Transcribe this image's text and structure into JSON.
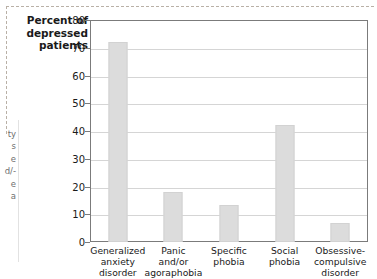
{
  "chart_data": {
    "type": "bar",
    "title": "",
    "ylabel": "Percent of depressed patients",
    "xlabel": "",
    "ylim": [
      0,
      80
    ],
    "yticks": [
      0,
      10,
      20,
      30,
      40,
      50,
      60,
      70,
      80
    ],
    "grid": true,
    "legend": false,
    "categories": [
      "Generalized anxiety disorder",
      "Panic and/or agoraphobia",
      "Specific phobia",
      "Social phobia",
      "Obsessive-compulsive disorder"
    ],
    "category_lines": [
      [
        "Generalized",
        "anxiety",
        "disorder"
      ],
      [
        "Panic",
        "and/or",
        "agoraphobia"
      ],
      [
        "Specific",
        "phobia"
      ],
      [
        "Social",
        "phobia"
      ],
      [
        "Obsessive-",
        "compulsive",
        "disorder"
      ]
    ],
    "values": [
      72,
      18,
      13.5,
      42,
      7
    ],
    "bar_color": "#dcdcdc",
    "axis_color": "#7b7b7b",
    "grid_color": "#d5d5d5"
  },
  "axis_title_lines": [
    "Percent of",
    "depressed",
    "patients"
  ],
  "edge_fragment_lines": [
    "ty",
    "s",
    "e",
    "d/-",
    "e",
    "a"
  ]
}
